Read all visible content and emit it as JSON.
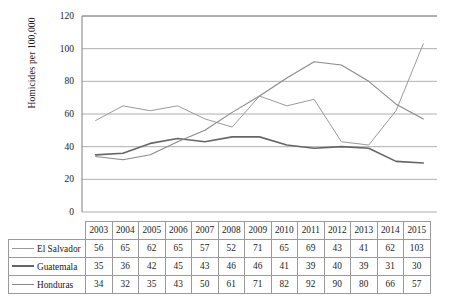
{
  "chart_data": {
    "type": "line",
    "title": "",
    "xlabel": "",
    "ylabel": "Homicides per 100,000",
    "categories": [
      "2003",
      "2004",
      "2005",
      "2006",
      "2007",
      "2008",
      "2009",
      "2010",
      "2011",
      "2012",
      "2013",
      "2014",
      "2015"
    ],
    "ylim": [
      0,
      120
    ],
    "yticks": [
      0,
      20,
      40,
      60,
      80,
      100,
      120
    ],
    "grid": "horizontal",
    "legend_position": "table-left",
    "series": [
      {
        "name": "El Salvador",
        "color": "#9a9a9a",
        "width": 1.0,
        "values": [
          56,
          65,
          62,
          65,
          57,
          52,
          71,
          65,
          69,
          43,
          41,
          62,
          103
        ]
      },
      {
        "name": "Guatemala",
        "color": "#666666",
        "width": 1.6,
        "values": [
          35,
          36,
          42,
          45,
          43,
          46,
          46,
          41,
          39,
          40,
          39,
          31,
          30
        ]
      },
      {
        "name": "Honduras",
        "color": "#8a8a8a",
        "width": 1.1,
        "values": [
          34,
          32,
          35,
          43,
          50,
          61,
          71,
          82,
          92,
          90,
          80,
          66,
          57
        ]
      }
    ]
  },
  "table": {
    "corner_label": "",
    "year_headers": [
      "2003",
      "2004",
      "2005",
      "2006",
      "2007",
      "2008",
      "2009",
      "2010",
      "2011",
      "2012",
      "2013",
      "2014",
      "2015"
    ],
    "rows": [
      {
        "label": "El Salvador",
        "values": [
          "56",
          "65",
          "62",
          "65",
          "57",
          "52",
          "71",
          "65",
          "69",
          "43",
          "41",
          "62",
          "103"
        ]
      },
      {
        "label": "Guatemala",
        "values": [
          "35",
          "36",
          "42",
          "45",
          "43",
          "46",
          "46",
          "41",
          "39",
          "40",
          "39",
          "31",
          "30"
        ]
      },
      {
        "label": "Honduras",
        "values": [
          "34",
          "32",
          "35",
          "43",
          "50",
          "61",
          "71",
          "82",
          "92",
          "90",
          "80",
          "66",
          "57"
        ]
      }
    ]
  },
  "axis": {
    "y_title": "Homicides per 100,000",
    "y_tick_labels": [
      "120",
      "100",
      "80",
      "60",
      "40",
      "20",
      "0"
    ]
  },
  "colors": {
    "background": "#ffffff",
    "axis_line": "#808080",
    "grid_line": "#9a9a9a",
    "table_border": "#9a9a9a",
    "text": "#1a1a1a"
  }
}
